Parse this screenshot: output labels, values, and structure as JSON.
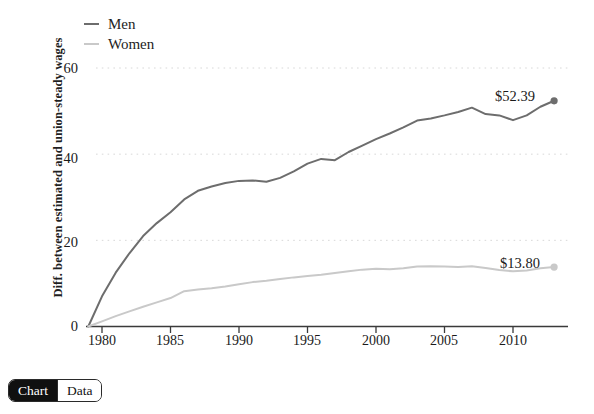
{
  "chart_data": {
    "type": "line",
    "title": "",
    "xlabel": "",
    "ylabel": "Diff. between estimated and union-steady wages",
    "xlim": [
      1978.8,
      2013.2
    ],
    "ylim": [
      0,
      66
    ],
    "yticks": [
      0,
      20,
      40,
      60
    ],
    "xticks": [
      1980,
      1985,
      1990,
      1995,
      2000,
      2005,
      2010
    ],
    "grid": "horizontal-dotted",
    "legend_position": "top-left",
    "x": [
      1979,
      1980,
      1981,
      1982,
      1983,
      1984,
      1985,
      1986,
      1987,
      1988,
      1989,
      1990,
      1991,
      1992,
      1993,
      1994,
      1995,
      1996,
      1997,
      1998,
      1999,
      2000,
      2001,
      2002,
      2003,
      2004,
      2005,
      2006,
      2007,
      2008,
      2009,
      2010,
      2011,
      2012,
      2013
    ],
    "series": [
      {
        "name": "Men",
        "color": "#6d6d6d",
        "end_label": "$52.39",
        "end_value": 52.39,
        "values": [
          0,
          7.0,
          12.5,
          17.0,
          21.0,
          24.0,
          26.5,
          29.5,
          31.5,
          32.5,
          33.3,
          33.8,
          33.9,
          33.6,
          34.5,
          36.0,
          37.8,
          38.9,
          38.6,
          40.5,
          42.0,
          43.5,
          44.8,
          46.2,
          47.8,
          48.3,
          49.0,
          49.8,
          50.8,
          49.3,
          49.0,
          47.9,
          49.0,
          51.0,
          52.39
        ]
      },
      {
        "name": "Women",
        "color": "#c9c9c9",
        "end_label": "$13.80",
        "end_value": 13.8,
        "values": [
          0,
          1.2,
          2.4,
          3.5,
          4.6,
          5.6,
          6.6,
          8.2,
          8.6,
          8.9,
          9.3,
          9.8,
          10.3,
          10.6,
          11.0,
          11.4,
          11.7,
          12.0,
          12.4,
          12.8,
          13.2,
          13.4,
          13.3,
          13.5,
          13.9,
          14.0,
          13.9,
          13.8,
          14.0,
          13.6,
          13.1,
          12.8,
          13.0,
          13.5,
          13.8
        ]
      }
    ]
  },
  "legend": {
    "items": [
      {
        "label": "Men",
        "color": "#6d6d6d"
      },
      {
        "label": "Women",
        "color": "#c9c9c9"
      }
    ]
  },
  "axis": {
    "y_title": "Diff. between estimated and union-steady wages",
    "y_tick_labels": [
      "60",
      "40",
      "20",
      "0"
    ],
    "x_tick_labels": [
      "1980",
      "1985",
      "1990",
      "1995",
      "2000",
      "2005",
      "2010"
    ]
  },
  "annotations": {
    "men_label": "$52.39",
    "women_label": "$13.80"
  },
  "toggle": {
    "chart_label": "Chart",
    "data_label": "Data",
    "selected": "Chart"
  }
}
